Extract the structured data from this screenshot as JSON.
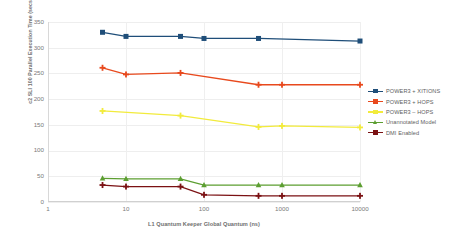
{
  "chart_data": {
    "type": "line",
    "title": "",
    "xlabel": "L1 Quantum Keeper Global Quantum (ns)",
    "ylabel": "c2 SLI 100 Parallel Execution Time (secs)",
    "xscale": "log",
    "xlim": [
      1,
      10000
    ],
    "ylim": [
      0,
      350
    ],
    "ytick_labels": [
      "350",
      "300",
      "250",
      "200",
      "150",
      "100",
      "50",
      "0"
    ],
    "ytick_values": [
      350,
      300,
      250,
      200,
      150,
      100,
      50,
      0
    ],
    "xtick_labels": [
      "1",
      "10",
      "100",
      "1000",
      "10000"
    ],
    "xtick_values": [
      1,
      10,
      100,
      1000,
      10000
    ],
    "grid": true,
    "legend_position": "right",
    "x": [
      5,
      10,
      50,
      100,
      500,
      1000,
      10000
    ],
    "series": [
      {
        "name": "POWER3 + XITIONS",
        "color": "#1f4e79",
        "marker": "square",
        "x": [
          5,
          10,
          50,
          100,
          500,
          10000
        ],
        "values": [
          330,
          322,
          322,
          318,
          318,
          313
        ]
      },
      {
        "name": "POWER3 + HOPS",
        "color": "#e8491d",
        "marker": "plus",
        "x": [
          5,
          10,
          50,
          500,
          1000,
          10000
        ],
        "values": [
          261,
          248,
          251,
          228,
          228,
          228
        ]
      },
      {
        "name": "POWER3 – HOPS",
        "color": "#f2eb3c",
        "marker": "plus",
        "x": [
          5,
          50,
          500,
          1000,
          10000
        ],
        "values": [
          177,
          168,
          146,
          148,
          145
        ]
      },
      {
        "name": "Unannotated Model",
        "color": "#5c9e31",
        "marker": "triangle",
        "x": [
          5,
          10,
          50,
          100,
          500,
          1000,
          10000
        ],
        "values": [
          46,
          45,
          45,
          33,
          33,
          33,
          33
        ]
      },
      {
        "name": "DMI Enabled",
        "color": "#7b1113",
        "marker": "plus",
        "x": [
          5,
          10,
          50,
          100,
          500,
          1000,
          10000
        ],
        "values": [
          33,
          30,
          30,
          14,
          12,
          12,
          12
        ]
      }
    ]
  }
}
